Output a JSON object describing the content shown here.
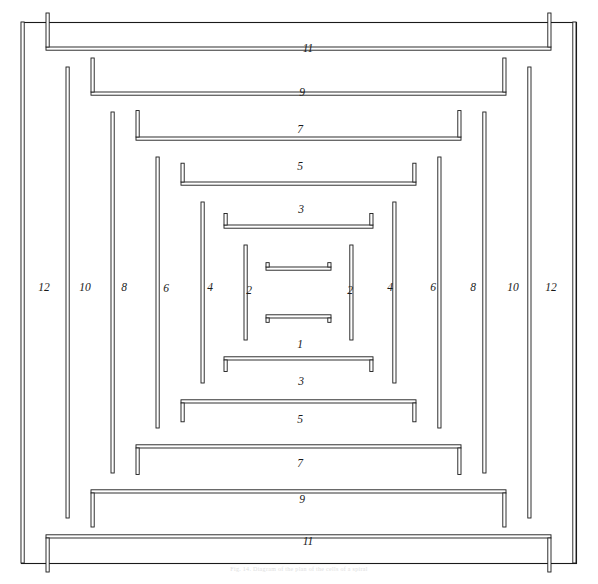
{
  "figure": {
    "caption": "Fig. 14. Diagram of the plan of the cells of a spiral",
    "ink_color": "#1a1a1a",
    "background_color": "#ffffff",
    "frame": {
      "x": 21,
      "y": 22,
      "width": 555,
      "height": 541
    }
  },
  "chart_data": {
    "type": "diagram",
    "ring_count": 12,
    "top_labels": [
      "11",
      "9",
      "7",
      "5",
      "3"
    ],
    "bottom_labels": [
      "1",
      "3",
      "5",
      "7",
      "9",
      "11"
    ],
    "left_labels": [
      "12",
      "10",
      "8",
      "6",
      "4",
      "2"
    ],
    "right_labels": [
      "2",
      "4",
      "6",
      "8",
      "10",
      "12"
    ],
    "rings": [
      {
        "n": 12,
        "inset": 0,
        "label_parity": "even",
        "axis": "horizontal"
      },
      {
        "n": 11,
        "inset": 25,
        "label_parity": "odd",
        "axis": "vertical"
      },
      {
        "n": 10,
        "inset": 45,
        "label_parity": "even",
        "axis": "horizontal"
      },
      {
        "n": 9,
        "inset": 70,
        "label_parity": "odd",
        "axis": "vertical"
      },
      {
        "n": 8,
        "inset": 90,
        "label_parity": "even",
        "axis": "horizontal"
      },
      {
        "n": 7,
        "inset": 115,
        "label_parity": "odd",
        "axis": "vertical"
      },
      {
        "n": 6,
        "inset": 135,
        "label_parity": "even",
        "axis": "horizontal"
      },
      {
        "n": 5,
        "inset": 160,
        "label_parity": "odd",
        "axis": "vertical"
      },
      {
        "n": 4,
        "inset": 180,
        "label_parity": "even",
        "axis": "horizontal"
      },
      {
        "n": 3,
        "inset": 203,
        "label_parity": "odd",
        "axis": "vertical"
      },
      {
        "n": 2,
        "inset": 223,
        "label_parity": "even",
        "axis": "horizontal"
      },
      {
        "n": 1,
        "inset": 245,
        "label_parity": "odd",
        "axis": "vertical"
      }
    ]
  },
  "labels": {
    "top": [
      {
        "text": "11",
        "x": 308,
        "y": 52
      },
      {
        "text": "9",
        "x": 302,
        "y": 96
      },
      {
        "text": "7",
        "x": 300,
        "y": 133
      },
      {
        "text": "5",
        "x": 300,
        "y": 170
      },
      {
        "text": "3",
        "x": 301,
        "y": 213
      }
    ],
    "bottom": [
      {
        "text": "1",
        "x": 300,
        "y": 348
      },
      {
        "text": "3",
        "x": 301,
        "y": 385
      },
      {
        "text": "5",
        "x": 300,
        "y": 423
      },
      {
        "text": "7",
        "x": 300,
        "y": 467
      },
      {
        "text": "9",
        "x": 302,
        "y": 503
      },
      {
        "text": "11",
        "x": 308,
        "y": 545
      }
    ],
    "left": [
      {
        "text": "12",
        "x": 44,
        "y": 291
      },
      {
        "text": "10",
        "x": 85,
        "y": 291
      },
      {
        "text": "8",
        "x": 124,
        "y": 291
      },
      {
        "text": "6",
        "x": 166,
        "y": 292
      },
      {
        "text": "4",
        "x": 210,
        "y": 291
      },
      {
        "text": "2",
        "x": 249,
        "y": 294
      }
    ],
    "right": [
      {
        "text": "2",
        "x": 350,
        "y": 294
      },
      {
        "text": "4",
        "x": 390,
        "y": 291
      },
      {
        "text": "6",
        "x": 433,
        "y": 291
      },
      {
        "text": "8",
        "x": 473,
        "y": 291
      },
      {
        "text": "10",
        "x": 513,
        "y": 291
      },
      {
        "text": "12",
        "x": 551,
        "y": 291
      }
    ]
  }
}
